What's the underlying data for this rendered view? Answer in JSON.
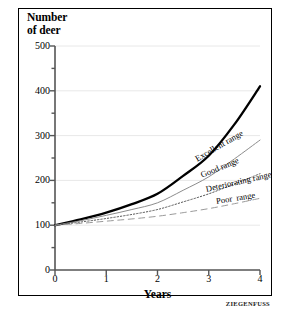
{
  "figure": {
    "title": "Number\nof deer",
    "credit": "ZIEGENFUSS"
  },
  "axes": {
    "y_label": "Number of deer",
    "x_label": "Years",
    "y_ticks": [
      "0",
      "100",
      "200",
      "300",
      "400",
      "500"
    ],
    "x_ticks": [
      "0",
      "1",
      "2",
      "3",
      "4"
    ]
  },
  "labels": {
    "excellent": "Excellent range",
    "good": "Good range",
    "deteriorating": "Deteriorating range",
    "poor": "Poor  range"
  },
  "colors": {
    "frame": "#000000",
    "grid": "#e8e8e8",
    "axis": "#555555",
    "excellent": "#000000",
    "good": "#8c8c8c",
    "deteriorating": "#555555",
    "poor": "#9a9a9a",
    "background": "#ffffff"
  },
  "chart_data": {
    "type": "line",
    "title": "Number of deer",
    "xlabel": "Years",
    "ylabel": "Number of deer",
    "xlim": [
      0,
      4
    ],
    "ylim": [
      0,
      500
    ],
    "grid": true,
    "legend": "inline-curve-labels",
    "x": [
      0,
      0.5,
      1,
      1.5,
      2,
      2.5,
      3,
      3.5,
      4
    ],
    "series": [
      {
        "name": "Excellent range",
        "style": "solid-thick",
        "color": "#000000",
        "values": [
          100,
          113,
          128,
          147,
          170,
          210,
          255,
          325,
          410
        ]
      },
      {
        "name": "Good range",
        "style": "solid-thin",
        "color": "#8c8c8c",
        "values": [
          100,
          110,
          122,
          135,
          150,
          178,
          208,
          248,
          290
        ]
      },
      {
        "name": "Deteriorating range",
        "style": "dotted",
        "color": "#555555",
        "values": [
          100,
          107,
          115,
          124,
          135,
          152,
          170,
          192,
          215
        ]
      },
      {
        "name": "Poor range",
        "style": "dashed",
        "color": "#9a9a9a",
        "values": [
          100,
          104,
          109,
          114,
          120,
          128,
          137,
          148,
          160
        ]
      }
    ]
  }
}
